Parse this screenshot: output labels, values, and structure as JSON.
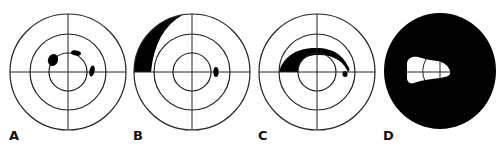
{
  "figure": {
    "panels": [
      {
        "label": "A",
        "pattern": "paracentral scotomas"
      },
      {
        "label": "B",
        "pattern": "peripheral nasal defect with paracentral scotoma"
      },
      {
        "label": "C",
        "pattern": "arcuate scotoma"
      },
      {
        "label": "D",
        "pattern": "advanced field loss with central island"
      }
    ]
  },
  "colors": {
    "defect": "#000000",
    "grid": "#222222",
    "background": "#ffffff"
  }
}
